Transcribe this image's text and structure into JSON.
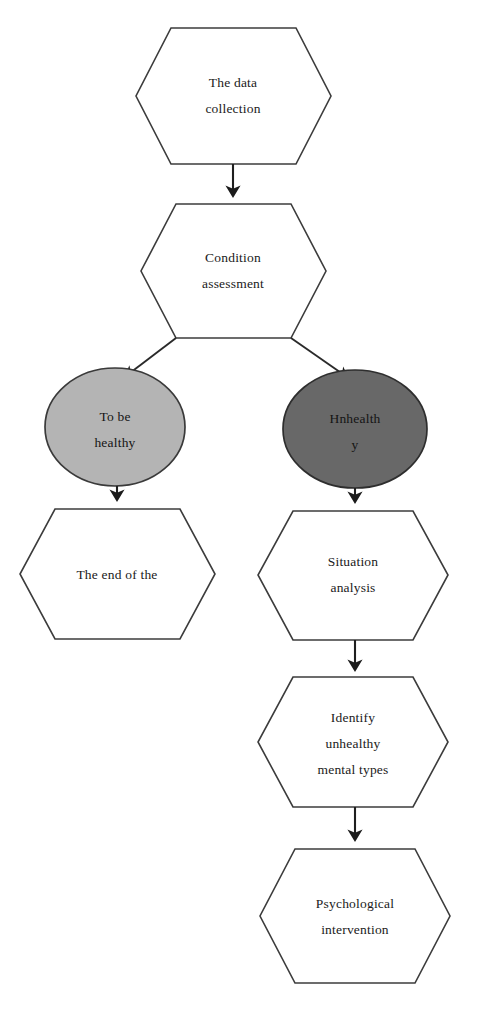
{
  "diagram": {
    "background_color": "#ffffff",
    "line_color": "#1f1f1f",
    "nodes": [
      {
        "id": "data-collection",
        "shape": "hexagon",
        "fill": "#ffffff",
        "lines": [
          "The data",
          "collection"
        ]
      },
      {
        "id": "condition-assessment",
        "shape": "hexagon",
        "fill": "#ffffff",
        "lines": [
          "Condition",
          "assessment"
        ]
      },
      {
        "id": "to-be-healthy",
        "shape": "ellipse",
        "fill": "#b4b4b4",
        "lines": [
          "To be",
          "healthy"
        ]
      },
      {
        "id": "unhealthy",
        "shape": "ellipse",
        "fill": "#686868",
        "lines": [
          "Hnhealth",
          "y"
        ]
      },
      {
        "id": "the-end-of-the",
        "shape": "hexagon",
        "fill": "#ffffff",
        "lines": [
          "The end of the"
        ]
      },
      {
        "id": "situation-analysis",
        "shape": "hexagon",
        "fill": "#ffffff",
        "lines": [
          "Situation",
          "analysis"
        ]
      },
      {
        "id": "identify-unhealthy-mental-types",
        "shape": "hexagon",
        "fill": "#ffffff",
        "lines": [
          "Identify",
          "unhealthy",
          "mental types"
        ]
      },
      {
        "id": "psychological-intervention",
        "shape": "hexagon",
        "fill": "#ffffff",
        "lines": [
          "Psychological",
          "intervention"
        ]
      }
    ],
    "edges": [
      {
        "from": "data-collection",
        "to": "condition-assessment",
        "style": "arrow-down"
      },
      {
        "from": "condition-assessment",
        "to": "to-be-healthy",
        "style": "arrow-diagonal-left"
      },
      {
        "from": "condition-assessment",
        "to": "unhealthy",
        "style": "arrow-diagonal-right"
      },
      {
        "from": "to-be-healthy",
        "to": "the-end-of-the",
        "style": "arrow-down"
      },
      {
        "from": "unhealthy",
        "to": "situation-analysis",
        "style": "arrow-down"
      },
      {
        "from": "situation-analysis",
        "to": "identify-unhealthy-mental-types",
        "style": "arrow-down"
      },
      {
        "from": "identify-unhealthy-mental-types",
        "to": "psychological-intervention",
        "style": "arrow-down"
      }
    ]
  }
}
